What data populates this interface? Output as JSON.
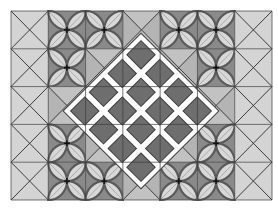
{
  "image": {
    "title": "",
    "description": "Quilt block pattern: 7x5 grid with light X-cells on the sides, orange-peel flower cells, and a central on-point diamond of 16 dark squares with white sashing"
  },
  "grid": {
    "cols": 7,
    "rows": 5,
    "left": 11,
    "top": 11,
    "right": 272,
    "bottom": 200,
    "cell_types": [
      [
        "x",
        "flower",
        "flower",
        "center",
        "flower",
        "flower",
        "x"
      ],
      [
        "x",
        "flower",
        "center",
        "center",
        "center",
        "flower",
        "x"
      ],
      [
        "x",
        "center",
        "center",
        "center",
        "center",
        "center",
        "x"
      ],
      [
        "x",
        "flower",
        "center",
        "center",
        "center",
        "flower",
        "x"
      ],
      [
        "x",
        "flower",
        "flower",
        "center",
        "flower",
        "flower",
        "x"
      ]
    ]
  },
  "diamond": {
    "center_x": 141,
    "center_y": 111,
    "count_per_side": 4,
    "square_size": 20,
    "step": 26.5
  },
  "colors": {
    "background": "#ffffff",
    "x_cell_fill": "#d4d4d4",
    "center_cell_fill": "#b4b4b4",
    "center_tri_light": "#c2c2c2",
    "flower_fill": "#8a8a8a",
    "petal_fill": "#d8d8d8",
    "petal_ring": "#5a5a5a",
    "line": "#3c3c3c",
    "diamond_fill": "#6e6e6e",
    "sashing": "#ffffff"
  }
}
